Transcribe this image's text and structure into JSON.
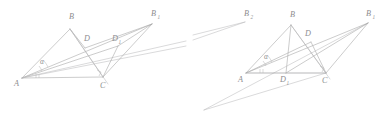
{
  "figure": {
    "background_color": "#ffffff",
    "stroke_color": "#a9a9aa",
    "label_color": "#8e8e90",
    "width": 386,
    "height": 123,
    "panels": [
      {
        "id": "left-figure",
        "name": "left-construction",
        "points": {
          "A": {
            "label": "A",
            "sub": "",
            "x": 22,
            "y": 78,
            "label_x": 14,
            "label_y": 86
          },
          "B": {
            "label": "B",
            "sub": "",
            "x": 70,
            "y": 29,
            "label_x": 69,
            "label_y": 19
          },
          "C": {
            "label": "C",
            "sub": "",
            "x": 103,
            "y": 77,
            "label_x": 100,
            "label_y": 88
          },
          "D": {
            "label": "D",
            "sub": "",
            "x": 85,
            "y": 48,
            "label_x": 84,
            "label_y": 41
          },
          "D1": {
            "label": "D",
            "sub": "1",
            "x": 118,
            "y": 46,
            "label_x": 112,
            "label_y": 41
          },
          "B1": {
            "label": "B",
            "sub": "1",
            "x": 152,
            "y": 24,
            "label_x": 151,
            "label_y": 16
          }
        },
        "angle_marker": {
          "label": "α",
          "x": 40,
          "y": 64
        },
        "right_angle_at": "C",
        "segments": [
          "A-B",
          "B-C",
          "A-C",
          "A-D",
          "A-D1",
          "A-B1",
          "C-D1",
          "C-B1",
          "D-B1",
          "D-D1",
          "D1-B1",
          "B-D"
        ]
      },
      {
        "id": "right-figure",
        "name": "right-construction",
        "points": {
          "A": {
            "label": "A",
            "sub": "",
            "x": 246,
            "y": 73,
            "label_x": 238,
            "label_y": 82
          },
          "B": {
            "label": "B",
            "sub": "",
            "x": 291,
            "y": 25,
            "label_x": 290,
            "label_y": 17
          },
          "C": {
            "label": "C",
            "sub": "",
            "x": 326,
            "y": 73,
            "label_x": 322,
            "label_y": 83
          },
          "D": {
            "label": "D",
            "sub": "",
            "x": 311,
            "y": 42,
            "label_x": 305,
            "label_y": 36
          },
          "D1": {
            "label": "D",
            "sub": "1",
            "x": 286,
            "y": 73,
            "label_x": 280,
            "label_y": 82
          },
          "B1": {
            "label": "B",
            "sub": "1",
            "x": 368,
            "y": 23,
            "label_x": 366,
            "label_y": 16
          },
          "B2": {
            "label": "B",
            "sub": "2",
            "x": 245,
            "y": 22,
            "label_x": 244,
            "label_y": 16
          },
          "P": {
            "label": "",
            "sub": "",
            "x": 204,
            "y": 110,
            "label_x": 0,
            "label_y": 0
          }
        },
        "angle_marker": {
          "label": "α",
          "x": 264,
          "y": 59
        },
        "right_angle_at": "C",
        "segments": [
          "A-B",
          "B-C",
          "A-C",
          "A-D",
          "A-B1",
          "C-D",
          "C-B1",
          "D-B1",
          "D1-B1",
          "D1-B",
          "P-B1",
          "P-C",
          "B2-P"
        ]
      }
    ]
  }
}
